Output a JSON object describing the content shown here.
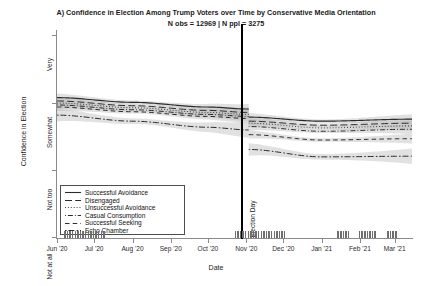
{
  "title": "A) Confidence in Election Among Trump Voters over Time by Conservative Media Orientation",
  "subtitle": "N obs = 12969 | N ppl = 3275",
  "annotation": {
    "election_day": "Election Day"
  },
  "axes": {
    "ylabel": "Confidence in Election",
    "xlabel": "Date",
    "yticklabels": [
      "Very",
      "Somewhat",
      "Not too",
      "Not at all"
    ],
    "xticklabels": [
      "Jun '20",
      "Jul '20",
      "Aug '20",
      "Sep '20",
      "Oct '20",
      "Nov '20",
      "Dec '20",
      "Jan '21",
      "Feb '21",
      "Mar '21"
    ]
  },
  "legend": {
    "items": [
      {
        "label": "Successful Avoidance",
        "dash": "solid"
      },
      {
        "label": "Disengaged",
        "dash": "longdash"
      },
      {
        "label": "Unsuccessful Avoidance",
        "dash": "dotted"
      },
      {
        "label": "Casual Consumption",
        "dash": "dotdash"
      },
      {
        "label": "Successful Seeking",
        "dash": "dashed"
      },
      {
        "label": "Echo Chamber",
        "dash": "twodash"
      }
    ]
  },
  "colors": {
    "line": "#2b2b2b",
    "ribbon": "#b8b8b8",
    "axis": "#8a8a8a",
    "rug": "#6e6e6e",
    "election_day_line": "#000000",
    "background": "#ffffff"
  },
  "chart_data": {
    "type": "line",
    "title": "A) Confidence in Election Among Trump Voters over Time by Conservative Media Orientation",
    "subtitle": "N obs = 12969 | N ppl = 3275",
    "xlabel": "Date",
    "ylabel": "Confidence in Election",
    "ylim": [
      1,
      4
    ],
    "ytick_values": [
      4,
      3,
      2,
      1
    ],
    "ytick_labels": [
      "Very",
      "Somewhat",
      "Not too",
      "Not at all"
    ],
    "xlim": [
      "2020-06-01",
      "2021-03-15"
    ],
    "xtick_labels": [
      "Jun '20",
      "Jul '20",
      "Aug '20",
      "Sep '20",
      "Oct '20",
      "Nov '20",
      "Dec '20",
      "Jan '21",
      "Feb '21",
      "Mar '21"
    ],
    "grid": false,
    "legend_position": "inside lower-left",
    "annotations": [
      {
        "text": "Election Day",
        "x": "2020-11-03",
        "type": "vline"
      }
    ],
    "ribbon": "95% confidence interval (grey band around each line)",
    "note": "Curves are discontinuous at Election Day (separate pre/post segments).",
    "series": [
      {
        "name": "Successful Avoidance",
        "dash": "solid",
        "pre": {
          "x": [
            "2020-06-01",
            "2020-08-01",
            "2020-10-01",
            "2020-11-03"
          ],
          "y": [
            3.07,
            3.0,
            2.93,
            2.9
          ]
        },
        "post": {
          "x": [
            "2020-11-03",
            "2021-01-01",
            "2021-03-15"
          ],
          "y": [
            2.78,
            2.72,
            2.75
          ]
        }
      },
      {
        "name": "Disengaged",
        "dash": "longdash",
        "pre": {
          "x": [
            "2020-06-01",
            "2020-08-01",
            "2020-10-01",
            "2020-11-03"
          ],
          "y": [
            3.02,
            2.95,
            2.88,
            2.85
          ]
        },
        "post": {
          "x": [
            "2020-11-03",
            "2021-01-01",
            "2021-03-15"
          ],
          "y": [
            2.72,
            2.66,
            2.69
          ]
        }
      },
      {
        "name": "Unsuccessful Avoidance",
        "dash": "dotted",
        "pre": {
          "x": [
            "2020-06-01",
            "2020-08-01",
            "2020-10-01",
            "2020-11-03"
          ],
          "y": [
            2.99,
            2.92,
            2.85,
            2.82
          ]
        },
        "post": {
          "x": [
            "2020-11-03",
            "2021-01-01",
            "2021-03-15"
          ],
          "y": [
            2.69,
            2.62,
            2.65
          ]
        }
      },
      {
        "name": "Casual Consumption",
        "dash": "dotdash",
        "pre": {
          "x": [
            "2020-06-01",
            "2020-08-01",
            "2020-10-01",
            "2020-11-03"
          ],
          "y": [
            2.96,
            2.89,
            2.82,
            2.79
          ]
        },
        "post": {
          "x": [
            "2020-11-03",
            "2021-01-01",
            "2021-03-15"
          ],
          "y": [
            2.64,
            2.57,
            2.6
          ]
        }
      },
      {
        "name": "Successful Seeking",
        "dash": "dashed",
        "pre": {
          "x": [
            "2020-06-01",
            "2020-08-01",
            "2020-10-01",
            "2020-11-03"
          ],
          "y": [
            2.93,
            2.86,
            2.79,
            2.76
          ]
        },
        "post": {
          "x": [
            "2020-11-03",
            "2021-01-01",
            "2021-03-15"
          ],
          "y": [
            2.52,
            2.44,
            2.46
          ]
        }
      },
      {
        "name": "Echo Chamber",
        "dash": "twodash",
        "pre": {
          "x": [
            "2020-06-01",
            "2020-08-01",
            "2020-10-01",
            "2020-11-03"
          ],
          "y": [
            2.81,
            2.72,
            2.63,
            2.59
          ]
        },
        "post": {
          "x": [
            "2020-11-03",
            "2021-01-01",
            "2021-03-15"
          ],
          "y": [
            2.3,
            2.19,
            2.2
          ]
        }
      }
    ],
    "rug": {
      "description": "observation-density rug marks along x axis",
      "clusters": [
        [
          0.02,
          0.13
        ],
        [
          0.5,
          0.64
        ],
        [
          0.79,
          0.82
        ],
        [
          0.85,
          0.9
        ],
        [
          0.93,
          0.955
        ]
      ]
    }
  }
}
